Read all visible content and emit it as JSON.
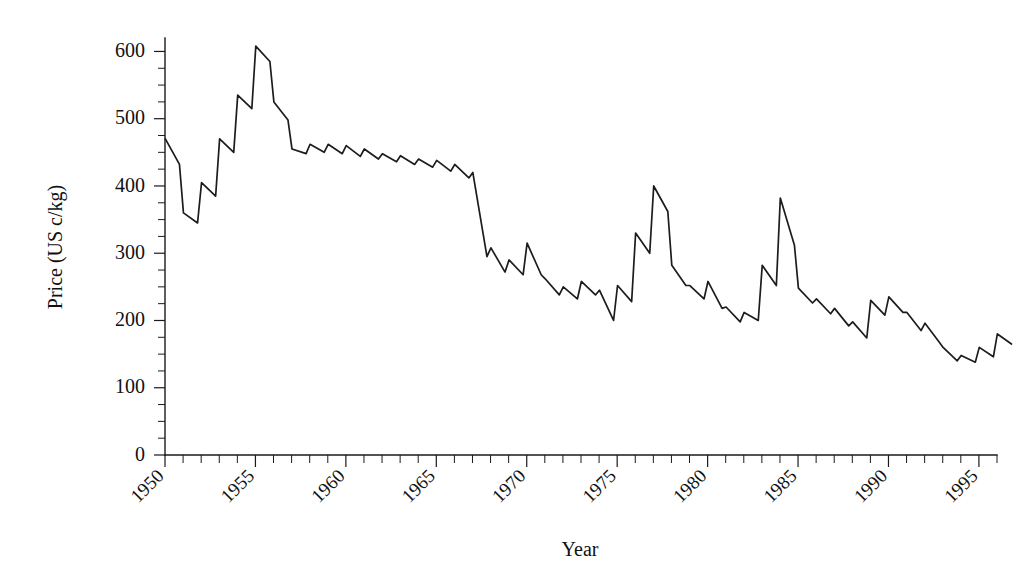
{
  "chart_data": {
    "type": "line",
    "title": "",
    "xlabel": "Year",
    "ylabel": "Price (US c/kg)",
    "xlim": [
      1950,
      1996
    ],
    "ylim": [
      0,
      620
    ],
    "grid": false,
    "legend": null,
    "axis_style": "open-left-bottom",
    "series_name": "Price",
    "y_ticks_major": [
      0,
      100,
      200,
      300,
      400,
      500,
      600
    ],
    "y_tick_labels": [
      "0",
      "100",
      "200",
      "300",
      "400",
      "500",
      "600"
    ],
    "y_ticks_minor_step": 25,
    "x_ticks_major": [
      1950,
      1955,
      1960,
      1965,
      1970,
      1975,
      1980,
      1985,
      1990,
      1995
    ],
    "x_tick_labels": [
      "1950",
      "1955",
      "1960",
      "1965",
      "1970",
      "1975",
      "1980",
      "1985",
      "1990",
      "1995"
    ],
    "x_ticks_minor_step": 1,
    "x": [
      1950,
      1951,
      1952,
      1953,
      1954,
      1955,
      1956,
      1957,
      1958,
      1959,
      1960,
      1961,
      1962,
      1963,
      1964,
      1965,
      1966,
      1967,
      1968,
      1969,
      1970,
      1971,
      1972,
      1973,
      1974,
      1975,
      1976,
      1977,
      1978,
      1979,
      1980,
      1981,
      1982,
      1983,
      1984,
      1985,
      1986,
      1987,
      1988,
      1989,
      1990,
      1991,
      1992,
      1993,
      1994,
      1995,
      1996
    ],
    "season_start": [
      470,
      360,
      405,
      470,
      535,
      608,
      525,
      455,
      462,
      462,
      460,
      455,
      448,
      445,
      440,
      438,
      432,
      420,
      308,
      290,
      315,
      262,
      250,
      258,
      245,
      252,
      330,
      400,
      282,
      252,
      258,
      220,
      212,
      282,
      382,
      248,
      232,
      218,
      198,
      230,
      235,
      212,
      196,
      160,
      148,
      160,
      180
    ],
    "season_end": [
      432,
      345,
      385,
      450,
      515,
      585,
      498,
      448,
      450,
      448,
      444,
      440,
      436,
      432,
      428,
      422,
      412,
      295,
      272,
      268,
      268,
      238,
      232,
      238,
      200,
      228,
      300,
      362,
      252,
      232,
      218,
      198,
      200,
      252,
      312,
      226,
      210,
      192,
      174,
      208,
      212,
      185,
      168,
      140,
      138,
      146,
      165
    ],
    "values_annual_peak": [
      470,
      360,
      405,
      470,
      535,
      608,
      525,
      455,
      462,
      462,
      460,
      455,
      448,
      445,
      440,
      438,
      432,
      420,
      308,
      290,
      315,
      262,
      250,
      258,
      245,
      252,
      330,
      400,
      282,
      252,
      258,
      220,
      212,
      282,
      382,
      248,
      232,
      218,
      198,
      230,
      235,
      212,
      196,
      160,
      148,
      160,
      180
    ],
    "notable_points": [
      {
        "year": 1955,
        "value": 608,
        "note": "all-time maximum"
      },
      {
        "year": 1951,
        "value": 345,
        "note": "early trough"
      },
      {
        "year": 1977,
        "value": 400,
        "note": "local peak"
      },
      {
        "year": 1984,
        "value": 382,
        "note": "local peak"
      },
      {
        "year": 1994,
        "value": 138,
        "note": "all-time minimum"
      }
    ]
  },
  "geometry": {
    "plot_left_px": 165,
    "plot_bottom_px": 455,
    "plot_right_px": 997,
    "plot_top_px": 38,
    "px_per_year": 18.06
  },
  "colors": {
    "ink": "#1c1c1c",
    "axis": "#1a1a1a",
    "background": "#ffffff"
  }
}
